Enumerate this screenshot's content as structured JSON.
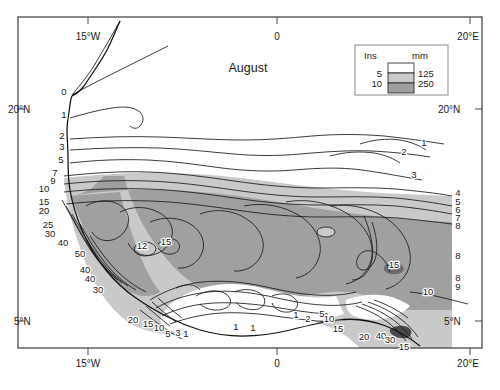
{
  "figure": {
    "title": "August",
    "frame": {
      "x": 18,
      "y": 17,
      "width": 464,
      "height": 331,
      "stroke": "#4a4a4a"
    }
  },
  "axes": {
    "top_ticks": [
      {
        "label": "15°W",
        "x": 88
      },
      {
        "label": "0",
        "x": 277
      },
      {
        "label": "20°E",
        "x": 470
      }
    ],
    "bottom_ticks": [
      {
        "label": "15°W",
        "x": 88
      },
      {
        "label": "0",
        "x": 277
      },
      {
        "label": "20°E",
        "x": 470
      }
    ],
    "left_ticks": [
      {
        "label": "20°N",
        "y": 112
      },
      {
        "label": "5°N",
        "y": 324
      }
    ],
    "right_ticks": [
      {
        "label": "20°N",
        "y": 112
      },
      {
        "label": "5°N",
        "y": 324
      }
    ]
  },
  "legend": {
    "box": {
      "x": 355,
      "y": 45,
      "width": 93,
      "height": 50
    },
    "header_left": "Ins",
    "header_right": "mm",
    "rows": [
      {
        "ins": "",
        "mm": "",
        "color": "#ffffff"
      },
      {
        "ins": "5",
        "mm": "125",
        "color": "#c9c9c9"
      },
      {
        "ins": "10",
        "mm": "250",
        "color": "#a0a0a0"
      }
    ]
  },
  "colors": {
    "band_white": "#ffffff",
    "band_light_gray": "#c9c9c9",
    "band_dark_gray": "#a0a0a0",
    "contour_line": "#1a1a1a",
    "frame": "#4a4a4a",
    "text": "#1a1a1a"
  },
  "chart_data": {
    "type": "contour-map",
    "title": "August",
    "variable": "Rainfall",
    "units_primary": "Ins",
    "units_secondary": "mm",
    "shading_breaks": [
      {
        "ins": 5,
        "mm": 125
      },
      {
        "ins": 10,
        "mm": 250
      }
    ],
    "xlabel": "",
    "ylabel": "",
    "xlim": [
      "15°W",
      "20°E"
    ],
    "ylim": [
      "5°N",
      "20°N"
    ],
    "grid": false,
    "legend_position": "top-right",
    "contour_labels": [
      {
        "value": "0",
        "x": 64,
        "y": 95
      },
      {
        "value": "1",
        "x": 64,
        "y": 118
      },
      {
        "value": "2",
        "x": 62,
        "y": 139
      },
      {
        "value": "3",
        "x": 62,
        "y": 150
      },
      {
        "value": "5",
        "x": 61,
        "y": 163
      },
      {
        "value": "7",
        "x": 55,
        "y": 176
      },
      {
        "value": "9",
        "x": 53,
        "y": 184
      },
      {
        "value": "10",
        "x": 44,
        "y": 192
      },
      {
        "value": "15",
        "x": 44,
        "y": 205
      },
      {
        "value": "20",
        "x": 44,
        "y": 214
      },
      {
        "value": "25",
        "x": 48,
        "y": 228
      },
      {
        "value": "30",
        "x": 50,
        "y": 237
      },
      {
        "value": "40",
        "x": 63,
        "y": 246
      },
      {
        "value": "50",
        "x": 80,
        "y": 257
      },
      {
        "value": "40",
        "x": 85,
        "y": 273
      },
      {
        "value": "40",
        "x": 90,
        "y": 282
      },
      {
        "value": "30",
        "x": 98,
        "y": 293
      },
      {
        "value": "12",
        "x": 142,
        "y": 249
      },
      {
        "value": "15",
        "x": 166,
        "y": 245
      },
      {
        "value": "20",
        "x": 133,
        "y": 323
      },
      {
        "value": "15",
        "x": 148,
        "y": 327
      },
      {
        "value": "10",
        "x": 159,
        "y": 331
      },
      {
        "value": "5",
        "x": 168,
        "y": 337
      },
      {
        "value": "3",
        "x": 178,
        "y": 336
      },
      {
        "value": "1",
        "x": 186,
        "y": 337
      },
      {
        "value": "1",
        "x": 236,
        "y": 330
      },
      {
        "value": "1",
        "x": 253,
        "y": 331
      },
      {
        "value": "2",
        "x": 308,
        "y": 322
      },
      {
        "value": "1",
        "x": 296,
        "y": 318
      },
      {
        "value": "5",
        "x": 322,
        "y": 317
      },
      {
        "value": "10",
        "x": 329,
        "y": 322
      },
      {
        "value": "15",
        "x": 338,
        "y": 332
      },
      {
        "value": "20",
        "x": 364,
        "y": 340
      },
      {
        "value": "40",
        "x": 381,
        "y": 339
      },
      {
        "value": "30",
        "x": 390,
        "y": 343
      },
      {
        "value": "15",
        "x": 404,
        "y": 350
      },
      {
        "value": "15",
        "x": 394,
        "y": 268
      },
      {
        "value": "10",
        "x": 428,
        "y": 295
      },
      {
        "value": "1",
        "x": 424,
        "y": 146
      },
      {
        "value": "2",
        "x": 404,
        "y": 155
      },
      {
        "value": "3",
        "x": 414,
        "y": 178
      },
      {
        "value": "4",
        "x": 458,
        "y": 196
      },
      {
        "value": "5",
        "x": 458,
        "y": 205
      },
      {
        "value": "6",
        "x": 458,
        "y": 213
      },
      {
        "value": "7",
        "x": 458,
        "y": 221
      },
      {
        "value": "8",
        "x": 458,
        "y": 229
      },
      {
        "value": "8",
        "x": 458,
        "y": 259
      },
      {
        "value": "8",
        "x": 458,
        "y": 281
      },
      {
        "value": "9",
        "x": 458,
        "y": 290
      }
    ]
  }
}
